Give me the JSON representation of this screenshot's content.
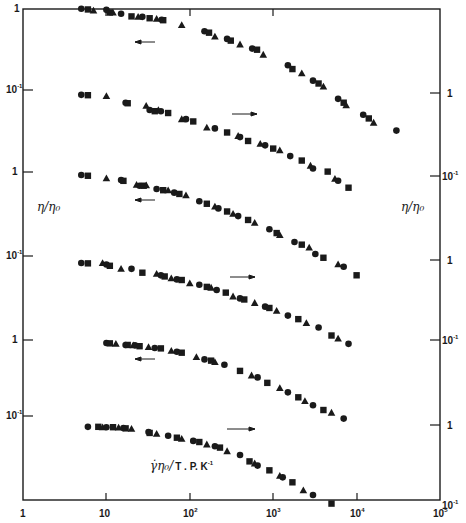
{
  "chart_data": {
    "type": "scatter",
    "title": "",
    "xlabel": "γ̇η₀/T . P. K⁻¹",
    "ylabel_left": "η/η₀",
    "ylabel_right": "η/η₀",
    "xscale": "log",
    "xlim": [
      1,
      100000
    ],
    "x_ticks": [
      "1",
      "10",
      "10²",
      "10³",
      "10⁴",
      "10⁵"
    ],
    "left_y_ticks": [
      "1",
      "10⁻¹",
      "1",
      "10⁻¹",
      "1",
      "10⁻¹"
    ],
    "right_y_ticks": [
      "1",
      "10⁻¹",
      "1",
      "10⁻¹",
      "1",
      "10⁻¹"
    ],
    "grid": false,
    "legend": "none (markers: circle, square, triangle)",
    "annotations": [
      "arrow left (curves 1,3,5 read on left axis)",
      "arrow right (curves 2,4,6 read on right axis)"
    ],
    "series_note": "Six vertically offset master curves of reduced viscosity vs reduced shear rate; marker shapes denote different samples/temperatures",
    "curves": [
      {
        "name": "curve 1",
        "axis": "left",
        "arrow": "left",
        "points": [
          [
            5,
            0.98
          ],
          [
            6,
            0.96
          ],
          [
            7,
            0.93
          ],
          [
            10,
            0.95
          ],
          [
            11,
            0.88
          ],
          [
            12,
            0.88
          ],
          [
            15,
            0.85
          ],
          [
            20,
            0.79
          ],
          [
            24,
            0.78
          ],
          [
            27,
            0.78
          ],
          [
            33,
            0.75
          ],
          [
            40,
            0.74
          ],
          [
            46,
            0.72
          ],
          [
            48,
            0.71
          ],
          [
            80,
            0.62
          ],
          [
            150,
            0.52
          ],
          [
            170,
            0.5
          ],
          [
            200,
            0.45
          ],
          [
            280,
            0.42
          ],
          [
            310,
            0.4
          ],
          [
            400,
            0.36
          ],
          [
            560,
            0.32
          ],
          [
            640,
            0.31
          ],
          [
            760,
            0.27
          ],
          [
            1500,
            0.2
          ],
          [
            1700,
            0.18
          ],
          [
            2200,
            0.16
          ],
          [
            3000,
            0.13
          ],
          [
            3500,
            0.12
          ],
          [
            4000,
            0.11
          ],
          [
            6000,
            0.078
          ],
          [
            7000,
            0.07
          ],
          [
            7500,
            0.065
          ],
          [
            12000,
            0.05
          ],
          [
            14000,
            0.045
          ],
          [
            16000,
            0.04
          ],
          [
            30000,
            0.032
          ]
        ]
      },
      {
        "name": "curve 2",
        "axis": "right",
        "arrow": "right",
        "points": [
          [
            5,
            0.095
          ],
          [
            6,
            0.094
          ],
          [
            10,
            0.092
          ],
          [
            17,
            0.076
          ],
          [
            18,
            0.075
          ],
          [
            30,
            0.07
          ],
          [
            33,
            0.062
          ],
          [
            38,
            0.06
          ],
          [
            42,
            0.062
          ],
          [
            45,
            0.06
          ],
          [
            55,
            0.057
          ],
          [
            80,
            0.048
          ],
          [
            90,
            0.048
          ],
          [
            110,
            0.045
          ],
          [
            160,
            0.038
          ],
          [
            200,
            0.037
          ],
          [
            280,
            0.033
          ],
          [
            380,
            0.03
          ],
          [
            400,
            0.029
          ],
          [
            500,
            0.026
          ],
          [
            700,
            0.024
          ],
          [
            800,
            0.023
          ],
          [
            1000,
            0.021
          ],
          [
            1200,
            0.02
          ],
          [
            1600,
            0.017
          ],
          [
            2200,
            0.015
          ],
          [
            2800,
            0.013
          ],
          [
            3000,
            0.012
          ],
          [
            4500,
            0.011
          ],
          [
            5500,
            0.009
          ],
          [
            6000,
            0.0085
          ],
          [
            8000,
            0.007
          ]
        ]
      },
      {
        "name": "curve 3",
        "axis": "left",
        "arrow": "left",
        "points": [
          [
            5,
            0.92
          ],
          [
            6,
            0.9
          ],
          [
            10,
            0.84
          ],
          [
            15,
            0.8
          ],
          [
            16,
            0.78
          ],
          [
            23,
            0.7
          ],
          [
            25,
            0.68
          ],
          [
            28,
            0.68
          ],
          [
            30,
            0.69
          ],
          [
            40,
            0.62
          ],
          [
            48,
            0.6
          ],
          [
            55,
            0.6
          ],
          [
            65,
            0.56
          ],
          [
            75,
            0.54
          ],
          [
            90,
            0.52
          ],
          [
            130,
            0.44
          ],
          [
            160,
            0.41
          ],
          [
            200,
            0.38
          ],
          [
            220,
            0.36
          ],
          [
            280,
            0.33
          ],
          [
            330,
            0.31
          ],
          [
            380,
            0.29
          ],
          [
            500,
            0.26
          ],
          [
            600,
            0.24
          ],
          [
            900,
            0.2
          ],
          [
            1100,
            0.18
          ],
          [
            1200,
            0.17
          ],
          [
            1800,
            0.14
          ],
          [
            2200,
            0.13
          ],
          [
            2700,
            0.12
          ],
          [
            3200,
            0.1
          ],
          [
            4000,
            0.09
          ],
          [
            6000,
            0.075
          ],
          [
            7000,
            0.07
          ],
          [
            10000,
            0.055
          ]
        ]
      },
      {
        "name": "curve 4",
        "axis": "right",
        "arrow": "right",
        "points": [
          [
            5,
            0.092
          ],
          [
            6,
            0.091
          ],
          [
            9,
            0.092
          ],
          [
            10,
            0.088
          ],
          [
            11,
            0.085
          ],
          [
            15,
            0.078
          ],
          [
            20,
            0.078
          ],
          [
            27,
            0.07
          ],
          [
            40,
            0.068
          ],
          [
            45,
            0.065
          ],
          [
            50,
            0.063
          ],
          [
            60,
            0.06
          ],
          [
            70,
            0.058
          ],
          [
            80,
            0.057
          ],
          [
            100,
            0.052
          ],
          [
            130,
            0.05
          ],
          [
            160,
            0.047
          ],
          [
            180,
            0.046
          ],
          [
            210,
            0.043
          ],
          [
            270,
            0.04
          ],
          [
            330,
            0.036
          ],
          [
            400,
            0.034
          ],
          [
            450,
            0.033
          ],
          [
            600,
            0.03
          ],
          [
            800,
            0.027
          ],
          [
            900,
            0.026
          ],
          [
            1100,
            0.024
          ],
          [
            1500,
            0.021
          ],
          [
            2000,
            0.019
          ],
          [
            2500,
            0.017
          ],
          [
            3500,
            0.015
          ],
          [
            5000,
            0.012
          ],
          [
            6000,
            0.011
          ],
          [
            8000,
            0.0095
          ]
        ]
      },
      {
        "name": "curve 5",
        "axis": "left",
        "arrow": "left",
        "points": [
          [
            10,
            0.92
          ],
          [
            11,
            0.91
          ],
          [
            13,
            0.9
          ],
          [
            17,
            0.87
          ],
          [
            18,
            0.87
          ],
          [
            21,
            0.86
          ],
          [
            22,
            0.86
          ],
          [
            25,
            0.84
          ],
          [
            32,
            0.82
          ],
          [
            38,
            0.8
          ],
          [
            45,
            0.79
          ],
          [
            60,
            0.74
          ],
          [
            70,
            0.72
          ],
          [
            80,
            0.7
          ],
          [
            120,
            0.62
          ],
          [
            150,
            0.58
          ],
          [
            180,
            0.56
          ],
          [
            200,
            0.54
          ],
          [
            260,
            0.5
          ],
          [
            400,
            0.42
          ],
          [
            550,
            0.37
          ],
          [
            650,
            0.35
          ],
          [
            850,
            0.3
          ],
          [
            1200,
            0.26
          ],
          [
            1500,
            0.23
          ],
          [
            2000,
            0.2
          ],
          [
            2400,
            0.18
          ],
          [
            3000,
            0.16
          ],
          [
            4000,
            0.14
          ],
          [
            5000,
            0.13
          ],
          [
            7000,
            0.11
          ]
        ]
      },
      {
        "name": "curve 6",
        "axis": "right",
        "arrow": "right",
        "points": [
          [
            6,
            0.095
          ],
          [
            8,
            0.095
          ],
          [
            9,
            0.094
          ],
          [
            10,
            0.094
          ],
          [
            12,
            0.094
          ],
          [
            14,
            0.093
          ],
          [
            16,
            0.092
          ],
          [
            17,
            0.091
          ],
          [
            20,
            0.09
          ],
          [
            32,
            0.082
          ],
          [
            33,
            0.08
          ],
          [
            40,
            0.078
          ],
          [
            55,
            0.074
          ],
          [
            70,
            0.07
          ],
          [
            80,
            0.068
          ],
          [
            110,
            0.064
          ],
          [
            130,
            0.062
          ],
          [
            160,
            0.058
          ],
          [
            200,
            0.055
          ],
          [
            230,
            0.053
          ],
          [
            280,
            0.048
          ],
          [
            400,
            0.043
          ],
          [
            520,
            0.036
          ],
          [
            600,
            0.034
          ],
          [
            650,
            0.032
          ],
          [
            900,
            0.028
          ],
          [
            1200,
            0.024
          ],
          [
            1300,
            0.023
          ],
          [
            1700,
            0.02
          ],
          [
            2300,
            0.016
          ],
          [
            3000,
            0.014
          ],
          [
            5000,
            0.011
          ]
        ]
      }
    ]
  },
  "labels": {
    "x_ticks": [
      "1",
      "10",
      "10",
      "10",
      "10",
      "10"
    ],
    "x_tick_sups": [
      "",
      "",
      "2",
      "3",
      "4",
      "5"
    ],
    "left_ticks": [
      "1",
      "10",
      "1",
      "10",
      "1",
      "10"
    ],
    "left_tick_sups": [
      "",
      "-1",
      "",
      "-1",
      "",
      "-1"
    ],
    "right_ticks": [
      "1",
      "10",
      "1",
      "10",
      "1",
      "10"
    ],
    "right_tick_sups": [
      "",
      "-1",
      "",
      "-1",
      "",
      "-1"
    ],
    "ylabel_left": "η/η₀",
    "ylabel_right": "η/η₀",
    "xlabel_main": "γ̇η₀/",
    "xlabel_rest": "T . P. K",
    "xlabel_sup": "-1"
  },
  "colors": {
    "ink": "#1a1a1a",
    "background": "#ffffff"
  }
}
